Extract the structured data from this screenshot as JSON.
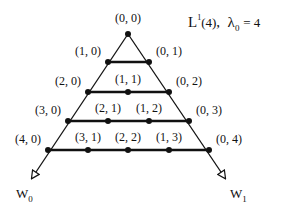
{
  "title": {
    "symbol": "L",
    "superscript": "1",
    "argument": "(4)",
    "separator": ",",
    "lambda_label": "λ",
    "lambda_sub": "0",
    "lambda_value": "= 4"
  },
  "nodes": [
    {
      "label": "(0, 0)",
      "x": 128,
      "y": 34
    },
    {
      "label": "(1, 0)",
      "x": 108,
      "y": 62
    },
    {
      "label": "(0, 1)",
      "x": 149,
      "y": 62
    },
    {
      "label": "(2, 0)",
      "x": 88,
      "y": 92
    },
    {
      "label": "(1, 1)",
      "x": 128,
      "y": 92
    },
    {
      "label": "(0, 2)",
      "x": 169,
      "y": 92
    },
    {
      "label": "(3, 0)",
      "x": 68,
      "y": 121
    },
    {
      "label": "(2, 1)",
      "x": 108,
      "y": 121
    },
    {
      "label": "(1, 2)",
      "x": 149,
      "y": 121
    },
    {
      "label": "(0, 3)",
      "x": 189,
      "y": 121
    },
    {
      "label": "(4, 0)",
      "x": 48,
      "y": 150
    },
    {
      "label": "(3, 1)",
      "x": 88,
      "y": 150
    },
    {
      "label": "(2, 2)",
      "x": 128,
      "y": 150
    },
    {
      "label": "(1, 3)",
      "x": 169,
      "y": 150
    },
    {
      "label": "(0, 4)",
      "x": 209,
      "y": 150
    }
  ],
  "arrows": {
    "left": {
      "label": "W",
      "sub": "0"
    },
    "right": {
      "label": "W",
      "sub": "1"
    }
  }
}
